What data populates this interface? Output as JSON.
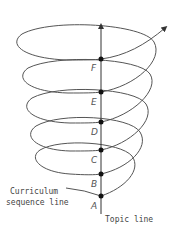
{
  "figure": {
    "type": "spiral-curriculum-diagram",
    "topic_line_label": "Topic line",
    "curriculum_line_label_1": "Curriculum",
    "curriculum_line_label_2": "sequence line",
    "points": [
      {
        "label": "A",
        "y": 196
      },
      {
        "label": "B",
        "y": 174
      },
      {
        "label": "C",
        "y": 150
      },
      {
        "label": "D",
        "y": 122
      },
      {
        "label": "E",
        "y": 92
      },
      {
        "label": "F",
        "y": 59
      }
    ],
    "colors": {
      "curve": "#555555",
      "topic_line": "#333333",
      "dots": "#111111",
      "background": "#ffffff"
    }
  }
}
